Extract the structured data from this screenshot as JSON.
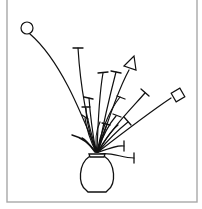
{
  "figure": {
    "colors": {
      "ink": "#111111",
      "frame": "#a8a8a8",
      "background": "#ffffff"
    }
  },
  "frame": {
    "x": 7,
    "y": -2,
    "w": 190,
    "h": 204
  },
  "vase": {
    "body_path": "M90 156 C78 164 78 184 86 190 L88 192 L106 192 L108 190 C116 184 116 164 104 156 Z",
    "neck_path": "M89 154 L105 154 L104 157 L90 157 Z"
  },
  "stems": [
    {
      "d": "M97 152 C80 110 60 60 30 34",
      "cap": null
    },
    {
      "d": "M97 152 C86 120 80 80 78 48",
      "cap": [
        73,
        48,
        83,
        48
      ]
    },
    {
      "d": "M97 152 C98 120 100 90 103 73",
      "cap": [
        98,
        73,
        108,
        72
      ]
    },
    {
      "d": "M98 152 C104 120 110 95 116 72",
      "cap": [
        111,
        71,
        121,
        73
      ]
    },
    {
      "d": "M98 152 C108 120 118 90 129 70",
      "cap": null
    },
    {
      "d": "M98 152 C110 130 130 110 145 93",
      "cap": [
        141,
        89,
        149,
        96
      ]
    },
    {
      "d": "M98 152 C120 135 150 112 171 98",
      "cap": null
    },
    {
      "d": "M96 152 C92 130 90 112 89 98",
      "cap": [
        84,
        97,
        93,
        99
      ]
    },
    {
      "d": "M96 152 C90 135 86 118 86 108",
      "cap": [
        82,
        107,
        90,
        107
      ]
    },
    {
      "d": "M96 152 C90 140 86 125 85 118",
      "cap": [
        82,
        115,
        88,
        119
      ]
    },
    {
      "d": "M97 152 C100 135 108 112 120 97",
      "cap": [
        117,
        96,
        125,
        99
      ]
    },
    {
      "d": "M97 152 C102 138 108 125 116 116",
      "cap": [
        113,
        114,
        121,
        117
      ]
    },
    {
      "d": "M97 152 C100 140 104 132 107 124",
      "cap": [
        102,
        123,
        110,
        125
      ]
    },
    {
      "d": "M98 152 C108 140 118 130 128 122",
      "cap": [
        124,
        117,
        131,
        125
      ]
    },
    {
      "d": "M99 152 C110 148 118 145 124 146",
      "cap": [
        124,
        141,
        124,
        151
      ]
    },
    {
      "d": "M100 154 C112 152 122 158 134 158",
      "cap": [
        134,
        153,
        134,
        163
      ]
    },
    {
      "d": "M97 152 C95 142 96 130 100 122",
      "cap": null
    },
    {
      "d": "M98 152 C103 142 112 130 118 125",
      "cap": null
    }
  ],
  "leaves": [
    {
      "d": "M96 152 C88 142 80 137 72 135"
    },
    {
      "d": "M95 152 C90 145 86 140 82 138"
    }
  ],
  "end_shapes": {
    "circle": {
      "cx": 27,
      "cy": 28,
      "r": 6
    },
    "triangle": {
      "points": "124,66 134,56 136,70"
    },
    "square": {
      "cx": 178,
      "cy": 95,
      "size": 10,
      "rotate": -30
    }
  }
}
